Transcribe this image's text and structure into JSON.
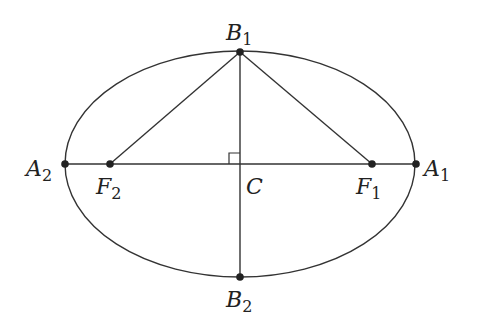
{
  "diagram": {
    "type": "ellipse",
    "stroke_color": "#333333",
    "background": "#ffffff",
    "ellipse": {
      "cx": 240,
      "cy": 164,
      "rx": 175,
      "ry": 113
    },
    "points": [
      {
        "id": "A1",
        "letter": "A",
        "sub": "1",
        "x": 416,
        "y": 164,
        "label_x": 424,
        "label_y": 176
      },
      {
        "id": "A2",
        "letter": "A",
        "sub": "2",
        "x": 65,
        "y": 164,
        "label_x": 26,
        "label_y": 176
      },
      {
        "id": "B1",
        "letter": "B",
        "sub": "1",
        "x": 240,
        "y": 52,
        "label_x": 226,
        "label_y": 40
      },
      {
        "id": "B2",
        "letter": "B",
        "sub": "2",
        "x": 240,
        "y": 277,
        "label_x": 226,
        "label_y": 307
      },
      {
        "id": "F1",
        "letter": "F",
        "sub": "1",
        "x": 372,
        "y": 164,
        "label_x": 356,
        "label_y": 194
      },
      {
        "id": "F2",
        "letter": "F",
        "sub": "2",
        "x": 110,
        "y": 164,
        "label_x": 96,
        "label_y": 194
      },
      {
        "id": "C",
        "letter": "C",
        "sub": "",
        "x": 240,
        "y": 164,
        "label_x": 246,
        "label_y": 194
      }
    ],
    "segments": [
      {
        "from": "A2",
        "to": "A1",
        "name": "major-axis"
      },
      {
        "from": "B1",
        "to": "B2",
        "name": "minor-axis"
      },
      {
        "from": "B1",
        "to": "F1",
        "name": "segment-b1-f1"
      },
      {
        "from": "B1",
        "to": "F2",
        "name": "segment-b1-f2"
      }
    ],
    "right_angle_marker": {
      "at": "C",
      "size": 11
    }
  }
}
